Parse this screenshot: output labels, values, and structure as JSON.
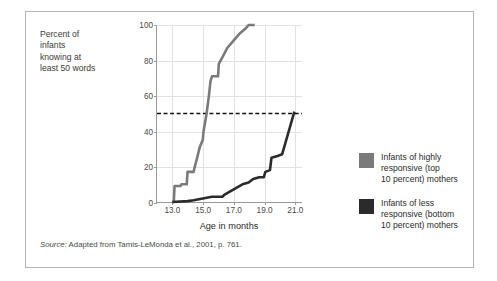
{
  "figure": {
    "y_axis_caption": "Percent of\ninfants\nknowing at\nleast 50 words",
    "source_prefix": "Source:",
    "source_text": " Adapted from Tamis-LeMonda et al., 2001, p. 761."
  },
  "legend": {
    "entries": [
      {
        "label": "Infants of highly\nresponsive (top\n10 percent) mothers",
        "color": "#7a7a7a",
        "name": "legend-swatch-highly-responsive"
      },
      {
        "label": "Infants of less\nresponsive (bottom\n10 percent) mothers",
        "color": "#2b2b2b",
        "name": "legend-swatch-less-responsive"
      }
    ]
  },
  "chart_data": {
    "type": "line",
    "title": "",
    "xlabel": "Age in months",
    "ylabel": "Percent of infants knowing at least 50 words",
    "xlim": [
      12.0,
      21.5
    ],
    "ylim": [
      0,
      100
    ],
    "xticks": [
      13.0,
      15.0,
      17.0,
      19.0,
      21.0
    ],
    "xtick_labels": [
      "13.0",
      "15.0",
      "17.0",
      "19.0",
      "21.0"
    ],
    "yticks": [
      0,
      20,
      40,
      60,
      80,
      100
    ],
    "ytick_labels": [
      "0",
      "20",
      "40",
      "60",
      "80",
      "100"
    ],
    "grid": true,
    "legend_position": "right",
    "reference_line": {
      "y": 50,
      "style": "dashed",
      "color": "#111111",
      "label": "50 percent"
    },
    "series": [
      {
        "name": "Infants of highly responsive (top 10 percent) mothers",
        "color": "#7a7a7a",
        "points": [
          [
            13.0,
            0
          ],
          [
            13.1,
            0
          ],
          [
            13.15,
            9
          ],
          [
            13.55,
            9
          ],
          [
            13.6,
            10
          ],
          [
            13.95,
            10
          ],
          [
            14.0,
            17
          ],
          [
            14.4,
            17
          ],
          [
            14.45,
            19
          ],
          [
            14.6,
            24
          ],
          [
            14.8,
            31
          ],
          [
            15.0,
            35
          ],
          [
            15.05,
            40
          ],
          [
            15.25,
            50
          ],
          [
            15.4,
            60
          ],
          [
            15.5,
            68
          ],
          [
            15.6,
            71
          ],
          [
            16.0,
            71
          ],
          [
            16.05,
            78
          ],
          [
            16.3,
            82
          ],
          [
            16.6,
            87
          ],
          [
            17.0,
            91
          ],
          [
            17.4,
            95
          ],
          [
            17.8,
            98
          ],
          [
            18.0,
            100
          ],
          [
            18.4,
            100
          ]
        ]
      },
      {
        "name": "Infants of less responsive (bottom 10 percent) mothers",
        "color": "#2b2b2b",
        "points": [
          [
            13.0,
            0
          ],
          [
            14.0,
            0.5
          ],
          [
            14.4,
            1
          ],
          [
            15.0,
            2
          ],
          [
            15.6,
            3
          ],
          [
            16.0,
            3
          ],
          [
            16.3,
            3
          ],
          [
            16.4,
            4
          ],
          [
            16.8,
            6
          ],
          [
            17.2,
            8
          ],
          [
            17.6,
            10
          ],
          [
            18.0,
            11
          ],
          [
            18.3,
            13
          ],
          [
            18.7,
            14
          ],
          [
            19.0,
            14
          ],
          [
            19.1,
            17
          ],
          [
            19.4,
            18
          ],
          [
            19.5,
            25
          ],
          [
            19.9,
            26
          ],
          [
            20.2,
            27
          ],
          [
            20.4,
            33
          ],
          [
            20.7,
            42
          ],
          [
            21.0,
            51
          ]
        ]
      }
    ]
  }
}
